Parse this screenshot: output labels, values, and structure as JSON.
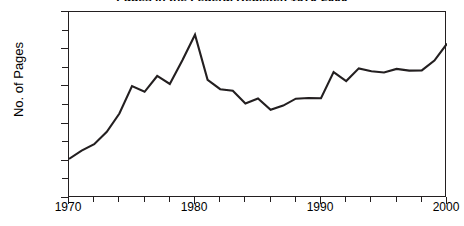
{
  "chart_data": {
    "type": "line",
    "title": "Pages in the Federal Register, 1970-2000",
    "xlabel": "",
    "ylabel": "No. of Pages",
    "xlim": [
      1970,
      2000
    ],
    "ylim": [
      0,
      100000
    ],
    "grid": false,
    "legend": "none",
    "y_tick_labels": [
      "0",
      "20,000",
      "40,000",
      "60,000",
      "80,000",
      "100,000"
    ],
    "y_tick_values": [
      0,
      20000,
      40000,
      60000,
      80000,
      100000
    ],
    "y_minor_tick_values": [
      10000,
      30000,
      50000,
      70000,
      90000
    ],
    "x_tick_labels": [
      "1970",
      "1980",
      "1990",
      "2000"
    ],
    "x_tick_values": [
      1970,
      1980,
      1990,
      2000
    ],
    "x_minor_tick_values": [
      1972,
      1974,
      1976,
      1978,
      1982,
      1984,
      1986,
      1988,
      1992,
      1994,
      1996,
      1998
    ],
    "line_color": "#231f20",
    "x": [
      1970,
      1971,
      1972,
      1973,
      1974,
      1975,
      1976,
      1977,
      1978,
      1979,
      1980,
      1981,
      1982,
      1983,
      1984,
      1985,
      1986,
      1987,
      1988,
      1989,
      1990,
      1991,
      1992,
      1993,
      1994,
      1995,
      1996,
      1997,
      1998,
      1999,
      2000
    ],
    "values": [
      21000,
      25500,
      28900,
      35600,
      45400,
      60200,
      57100,
      65600,
      61300,
      74100,
      87800,
      63500,
      58500,
      57700,
      50800,
      53500,
      47400,
      49700,
      53400,
      53800,
      53600,
      67700,
      62900,
      69700,
      68100,
      67500,
      69400,
      68500,
      68600,
      73900,
      83000
    ],
    "series": [
      {
        "name": "No. of Pages",
        "values": [
          21000,
          25500,
          28900,
          35600,
          45400,
          60200,
          57100,
          65600,
          61300,
          74100,
          87800,
          63500,
          58500,
          57700,
          50800,
          53500,
          47400,
          49700,
          53400,
          53800,
          53600,
          67700,
          62900,
          69700,
          68100,
          67500,
          69400,
          68500,
          68600,
          73900,
          83000
        ]
      }
    ],
    "annotations": []
  }
}
